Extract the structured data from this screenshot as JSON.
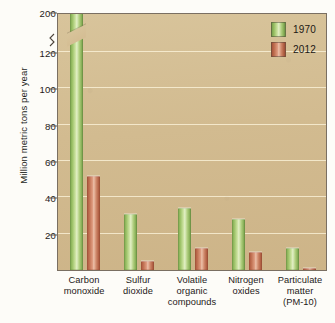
{
  "chart_data": {
    "type": "bar",
    "title": "",
    "subtitle": "",
    "xlabel": "",
    "ylabel": "Million metric tons per year",
    "categories": [
      "Carbon monoxide",
      "Sulfur dioxide",
      "Volatile organic compounds",
      "Nitrogen oxides",
      "Particulate matter (PM-10)"
    ],
    "category_lines": [
      [
        "Carbon",
        "monoxide"
      ],
      [
        "Sulfur",
        "dioxide"
      ],
      [
        "Volatile",
        "organic",
        "compounds"
      ],
      [
        "Nitrogen",
        "oxides"
      ],
      [
        "Particulate",
        "matter",
        "(PM-10)"
      ]
    ],
    "series": [
      {
        "name": "1970",
        "color": "#9cc267",
        "values": [
          197,
          31,
          34,
          28,
          12
        ]
      },
      {
        "name": "2012",
        "color": "#c06f51",
        "values": [
          52,
          5,
          12,
          10,
          1
        ]
      }
    ],
    "ylim": [
      0,
      200
    ],
    "yticks": [
      20,
      40,
      60,
      80,
      100,
      120,
      200
    ],
    "ytick_labels": [
      "20",
      "40",
      "60",
      "80",
      "100",
      "120",
      "200"
    ],
    "axis_break": {
      "present": true,
      "between": [
        120,
        200
      ],
      "note": "y-axis broken between 120 and 200"
    },
    "broken_bars": [
      "Carbon monoxide 1970"
    ],
    "grid": true,
    "grid_orientation": "horizontal",
    "legend_position": "top-right",
    "plot_background": "#d4bc91"
  },
  "legend": {
    "entries": [
      {
        "label": "1970",
        "color": "#9cc267"
      },
      {
        "label": "2012",
        "color": "#c06f51"
      }
    ]
  },
  "axis": {
    "y_title": "Million metric tons per year"
  }
}
